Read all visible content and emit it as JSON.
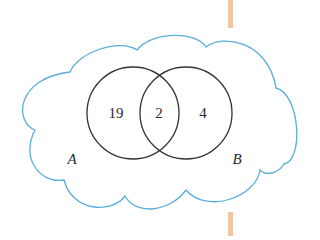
{
  "diagram": {
    "type": "venn",
    "universe_shape": "cloud",
    "colors": {
      "cloud_outline": "#5aaedc",
      "circle_outline": "#333333",
      "divider_bar": "#f2c7a3"
    },
    "sets": [
      {
        "name": "A",
        "label": "A"
      },
      {
        "name": "B",
        "label": "B"
      }
    ],
    "regions": {
      "only_a": "19",
      "a_and_b": "2",
      "only_b": "4"
    }
  }
}
